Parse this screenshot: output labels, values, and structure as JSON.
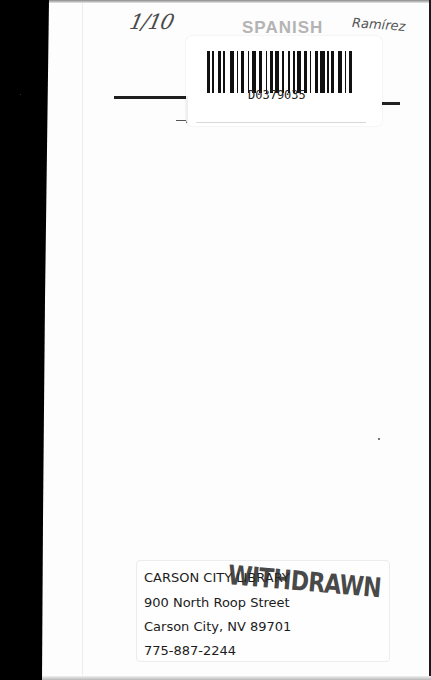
{
  "document": {
    "type": "scanned book cover (back/inside)",
    "handwritten_date": "1/10",
    "category_stamp": "SPANISH",
    "handwritten_author": "Ramírez"
  },
  "barcode_label": {
    "barcode_number": "D0379035"
  },
  "address_label": {
    "lines": [
      "CARSON CITY LIBRARY",
      "900 North Roop Street",
      "Carson City, NV 89701",
      "775-887-2244"
    ]
  },
  "stamp": {
    "text": "WITHDRAWN",
    "color": "#282828"
  },
  "colors": {
    "page": "#fdfdfd",
    "scan_background": "#000000",
    "ink": "#1c1c1c"
  }
}
